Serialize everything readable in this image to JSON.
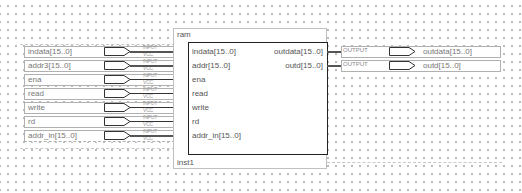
{
  "block": {
    "name": "ram",
    "instance": "inst1",
    "inputs": [
      "indata[15..0]",
      "addr[15..0]",
      "ena",
      "read",
      "write",
      "rd",
      "addr_in[15..0]"
    ],
    "outputs": [
      "outdata[15..0]",
      "outd[15..0]"
    ]
  },
  "input_pins": [
    {
      "label": "indata[15..0]",
      "type": "INPUT",
      "default": "VCC",
      "bus": true
    },
    {
      "label": "addr3[15..0]",
      "type": "INPUT",
      "default": "VCC",
      "bus": true
    },
    {
      "label": "ena",
      "type": "INPUT",
      "default": "VCC",
      "bus": false
    },
    {
      "label": "read",
      "type": "INPUT",
      "default": "VCC",
      "bus": false
    },
    {
      "label": "write",
      "type": "INPUT",
      "default": "VCC",
      "bus": false
    },
    {
      "label": "rd",
      "type": "INPUT",
      "default": "VCC",
      "bus": false
    },
    {
      "label": "addr_in[15..0]",
      "type": "INPUT",
      "default": "VCC",
      "bus": true
    }
  ],
  "output_pins": [
    {
      "label": "outdata[15..0]",
      "type": "OUTPUT",
      "bus": true
    },
    {
      "label": "outd[15..0]",
      "type": "OUTPUT",
      "bus": true
    }
  ],
  "colors": {
    "wire": "#333333",
    "block_border": "#222222",
    "pin_border": "#b0b0b0",
    "grid_dot": "#b8b8b8",
    "text": "#555555"
  }
}
